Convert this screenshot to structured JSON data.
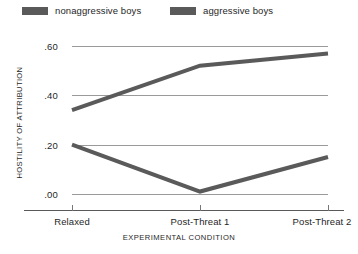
{
  "chart_data": {
    "type": "line",
    "title": "",
    "xlabel": "EXPERIMENTAL CONDITION",
    "ylabel": "HOSTILITY OF ATTRIBUTION",
    "categories": [
      "Relaxed",
      "Post-Threat 1",
      "Post-Threat 2"
    ],
    "ylim": [
      0.0,
      0.6
    ],
    "yticks": [
      0.0,
      0.2,
      0.4,
      0.6
    ],
    "ytick_labels": [
      ".00",
      ".20",
      ".40",
      ".60"
    ],
    "grid": "horizontal",
    "legend_position": "top",
    "series": [
      {
        "name": "nonaggressive boys",
        "values": [
          0.2,
          0.01,
          0.15
        ],
        "color": "#5a5a5a"
      },
      {
        "name": "aggressive boys",
        "values": [
          0.34,
          0.52,
          0.57
        ],
        "color": "#5a5a5a"
      }
    ]
  },
  "legend": {
    "entries": [
      {
        "label": "nonaggressive boys",
        "swatch": "legend-swatch-nonaggressive"
      },
      {
        "label": "aggressive boys",
        "swatch": "legend-swatch-aggressive"
      }
    ]
  },
  "axes": {
    "y_title": "HOSTILITY OF ATTRIBUTION",
    "x_title": "EXPERIMENTAL CONDITION",
    "y_tick_labels": [
      ".60",
      ".40",
      ".20",
      ".00"
    ],
    "x_tick_labels": [
      "Relaxed",
      "Post-Threat 1",
      "Post-Threat 2"
    ]
  },
  "colors": {
    "line": "#5a5a5a",
    "grid": "#9a9a9a",
    "axis": "#5a5a5a",
    "text": "#1f1f1f",
    "background": "#ffffff"
  }
}
